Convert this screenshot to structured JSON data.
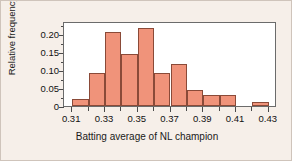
{
  "chart_data": {
    "type": "bar",
    "title": "",
    "subtitle": "",
    "xlabel": "Batting average of NL champion",
    "ylabel": "Relative frequency",
    "bin_width": 0.01,
    "xlim": [
      0.305,
      0.435
    ],
    "ylim": [
      0,
      0.235
    ],
    "grid": false,
    "legend": null,
    "bar_color": "#f0937a",
    "bar_edge_color": "#8a4a38",
    "plot_background": "#ffffff",
    "figure_background": "#f6efe9",
    "axis_color": "#6b6b6b",
    "x_tick_labels": [
      "0.31",
      "0.33",
      "0.35",
      "0.37",
      "0.39",
      "0.41",
      "0.43"
    ],
    "x_tick_values": [
      0.31,
      0.33,
      0.35,
      0.37,
      0.39,
      0.41,
      0.43
    ],
    "x_minor_tick_values": [
      0.32,
      0.34,
      0.36,
      0.38,
      0.4,
      0.42
    ],
    "y_tick_labels": [
      "0",
      "0.05",
      "0.10",
      "0.15",
      "0.20"
    ],
    "y_tick_values": [
      0,
      0.05,
      0.1,
      0.15,
      0.2
    ],
    "y_minor_tick_values": [
      0.025,
      0.075,
      0.125,
      0.175,
      0.225
    ],
    "bins": [
      {
        "left": 0.31,
        "right": 0.32,
        "value": 0.02
      },
      {
        "left": 0.32,
        "right": 0.33,
        "value": 0.09
      },
      {
        "left": 0.33,
        "right": 0.34,
        "value": 0.205
      },
      {
        "left": 0.34,
        "right": 0.35,
        "value": 0.145
      },
      {
        "left": 0.35,
        "right": 0.36,
        "value": 0.215
      },
      {
        "left": 0.36,
        "right": 0.37,
        "value": 0.09
      },
      {
        "left": 0.37,
        "right": 0.38,
        "value": 0.115
      },
      {
        "left": 0.38,
        "right": 0.39,
        "value": 0.045
      },
      {
        "left": 0.39,
        "right": 0.4,
        "value": 0.03
      },
      {
        "left": 0.4,
        "right": 0.41,
        "value": 0.03
      },
      {
        "left": 0.41,
        "right": 0.42,
        "value": 0.0
      },
      {
        "left": 0.42,
        "right": 0.43,
        "value": 0.01
      }
    ],
    "categories": [
      "0.31-0.32",
      "0.32-0.33",
      "0.33-0.34",
      "0.34-0.35",
      "0.35-0.36",
      "0.36-0.37",
      "0.37-0.38",
      "0.38-0.39",
      "0.39-0.40",
      "0.40-0.41",
      "0.41-0.42",
      "0.42-0.43"
    ],
    "values": [
      0.02,
      0.09,
      0.205,
      0.145,
      0.215,
      0.09,
      0.115,
      0.045,
      0.03,
      0.03,
      0.0,
      0.01
    ]
  }
}
